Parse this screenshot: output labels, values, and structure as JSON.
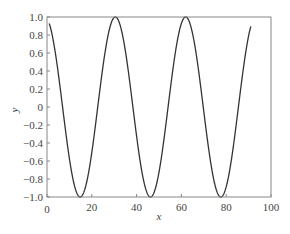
{
  "chart_data": {
    "type": "line",
    "title": "",
    "xlabel": "x",
    "ylabel": "y",
    "xlim": [
      0,
      100
    ],
    "ylim": [
      -1.0,
      1.0
    ],
    "grid": false,
    "legend": null,
    "x_ticks": [
      "0",
      "20",
      "40",
      "60",
      "80",
      "100"
    ],
    "x_tick_values": [
      0,
      20,
      40,
      60,
      80,
      100
    ],
    "y_ticks": [
      "1.0",
      "0.8",
      "0.6",
      "0.4",
      "0.2",
      "0",
      "−0.2",
      "−0.4",
      "−0.6",
      "−0.8",
      "−1.0"
    ],
    "y_tick_values": [
      1.0,
      0.8,
      0.6,
      0.4,
      0.2,
      0,
      -0.2,
      -0.4,
      -0.6,
      -0.8,
      -1.0
    ],
    "series": [
      {
        "name": "y",
        "color": "#333333",
        "function": "cos(2*pi*(x-30.5)/31.4)",
        "x_range": [
          1,
          91
        ],
        "key_points": [
          {
            "x": 1,
            "y": 0.92
          },
          {
            "x": 14.8,
            "y": -1.0
          },
          {
            "x": 30.5,
            "y": 1.0
          },
          {
            "x": 46.2,
            "y": -1.0
          },
          {
            "x": 61.9,
            "y": 1.0
          },
          {
            "x": 77.6,
            "y": -1.0
          },
          {
            "x": 91,
            "y": 0.91
          }
        ]
      }
    ]
  }
}
